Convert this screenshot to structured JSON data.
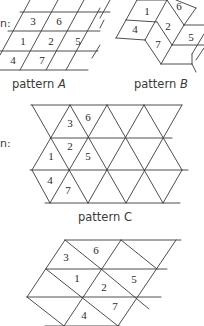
{
  "fragments": {
    "top_left": "n:",
    "middle_left": "n:"
  },
  "patterns": [
    {
      "id": "A",
      "label_prefix": "pattern ",
      "label_letter": "A",
      "cell_numbers": [
        "3",
        "6",
        "1",
        "2",
        "5",
        "4",
        "7"
      ]
    },
    {
      "id": "B",
      "label_prefix": "pattern ",
      "label_letter": "B",
      "cell_numbers": [
        "1",
        "6",
        "4",
        "2",
        "5",
        "7"
      ]
    },
    {
      "id": "C",
      "label_prefix": "pattern ",
      "label_letter": "C",
      "cell_numbers": [
        "3",
        "6",
        "2",
        "1",
        "5",
        "4",
        "7"
      ]
    },
    {
      "id": "D",
      "label_prefix": "",
      "label_letter": "",
      "cell_numbers": [
        "3",
        "6",
        "1",
        "2",
        "5",
        "7",
        "4"
      ]
    }
  ]
}
